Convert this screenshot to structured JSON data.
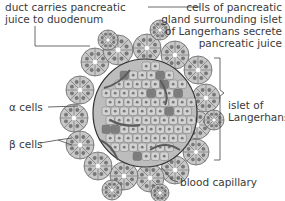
{
  "labels": {
    "duct": [
      "duct carries pancreatic",
      "juice to duodenum"
    ],
    "acinar": [
      "cells of pancreatic",
      "gland surrounding islet",
      "of Langerhans secrete",
      "pancreatic juice"
    ],
    "alpha": "α cells",
    "beta": "β cells",
    "islet": [
      "islet of",
      "Langerhans"
    ],
    "capillary": "blood capillary"
  },
  "colors": {
    "cell_fill": "#c8c8c8",
    "cell_stroke": "#555555",
    "nucleus": "#7a7a7a",
    "alpha_cell": "#7e7e7e",
    "islet_fill": "#bdbdbd",
    "capillary": "#5a5a5a",
    "leader": "#444444"
  }
}
